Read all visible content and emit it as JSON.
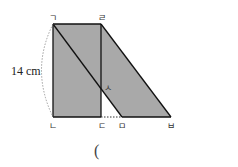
{
  "figure": {
    "labels": {
      "g": "ㄱ",
      "r": "ㄹ",
      "n": "ㄴ",
      "d": "ㄷ",
      "m": "ㅁ",
      "b": "ㅂ",
      "s": "ㅅ"
    },
    "dimension": "14 cm",
    "answer_paren": "(",
    "colors": {
      "fill": "#a9a9a9",
      "stroke": "#111111"
    }
  }
}
